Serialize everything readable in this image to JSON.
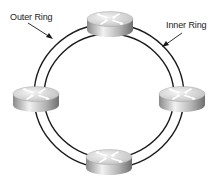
{
  "diagram": {
    "type": "dual-ring-network",
    "labels": {
      "outer_ring": "Outer Ring",
      "inner_ring": "Inner Ring"
    },
    "nodes": [
      {
        "id": "router-top",
        "icon": "router-icon",
        "cx": 110,
        "cy": 22
      },
      {
        "id": "router-left",
        "icon": "router-icon",
        "cx": 36,
        "cy": 98
      },
      {
        "id": "router-right",
        "icon": "router-icon",
        "cx": 182,
        "cy": 98
      },
      {
        "id": "router-bottom",
        "icon": "router-icon",
        "cx": 109,
        "cy": 160
      }
    ],
    "colors": {
      "ring": "#1a1a1a",
      "router_light": "#e6e6e6",
      "router_dark": "#7a7a7a",
      "text": "#222222"
    }
  }
}
